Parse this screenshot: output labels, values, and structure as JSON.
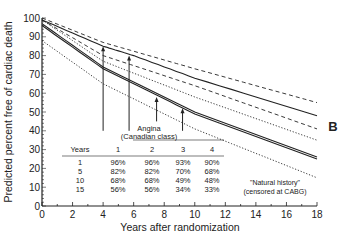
{
  "chart_data": {
    "type": "line",
    "title": "",
    "panel_label": "B",
    "xlabel": "Years after randomization",
    "ylabel": "Predicted percent free of cardiac death",
    "xlim": [
      0,
      18
    ],
    "ylim": [
      0,
      100
    ],
    "xticks": [
      0,
      2,
      4,
      6,
      8,
      10,
      12,
      14,
      16,
      18
    ],
    "yticks": [
      0,
      10,
      20,
      30,
      40,
      50,
      60,
      70,
      80,
      90,
      100
    ],
    "grid": false,
    "series": [
      {
        "name": "Angina class upper (dashed)",
        "style": "dashed",
        "x": [
          0,
          4,
          10,
          18
        ],
        "values": [
          100,
          87,
          73,
          55
        ]
      },
      {
        "name": "CABG surgery curve 1 (solid)",
        "style": "solid",
        "x": [
          0,
          4,
          6,
          10,
          18
        ],
        "values": [
          99,
          85,
          80,
          68,
          48
        ]
      },
      {
        "name": "Angina class 2 (dashed)",
        "style": "dashed",
        "x": [
          0,
          4,
          10,
          18
        ],
        "values": [
          99,
          80,
          64,
          41
        ]
      },
      {
        "name": "Angina class 3 (dotted)",
        "style": "dotted",
        "x": [
          0,
          4,
          10,
          18
        ],
        "values": [
          99,
          77,
          58,
          35
        ]
      },
      {
        "name": "CABG surgery curve 2 (solid)",
        "style": "solid",
        "x": [
          0,
          4,
          6,
          10,
          18
        ],
        "values": [
          97,
          74,
          66,
          50,
          26
        ]
      },
      {
        "name": "CABG surgery curve 3 (solid)",
        "style": "solid",
        "x": [
          0,
          4,
          6,
          10,
          18
        ],
        "values": [
          96,
          73,
          65,
          49,
          25
        ]
      },
      {
        "name": "Natural history (dotted)",
        "style": "dotted",
        "x": [
          0,
          4,
          10,
          18
        ],
        "values": [
          88,
          65,
          41,
          15
        ]
      }
    ],
    "arrows": [
      {
        "x": 4,
        "from": 40,
        "to": 85
      },
      {
        "x": 5.7,
        "from": 40,
        "to": 80
      },
      {
        "x": 7.5,
        "from": 45,
        "to": 58
      },
      {
        "x": 9.2,
        "from": 40,
        "to": 52
      }
    ],
    "annotations": {
      "table_title_1": "Angina",
      "table_title_2": "(Canadian class)",
      "natural_history_1": "\"Natural history\"",
      "natural_history_2": "(censored at CABG)"
    },
    "table": {
      "headers": [
        "Years",
        "1",
        "2",
        "3",
        "4"
      ],
      "rows": [
        [
          "1",
          "96%",
          "96%",
          "93%",
          "90%"
        ],
        [
          "5",
          "82%",
          "82%",
          "70%",
          "68%"
        ],
        [
          "10",
          "68%",
          "68%",
          "49%",
          "48%"
        ],
        [
          "15",
          "56%",
          "56%",
          "34%",
          "33%"
        ]
      ]
    }
  }
}
